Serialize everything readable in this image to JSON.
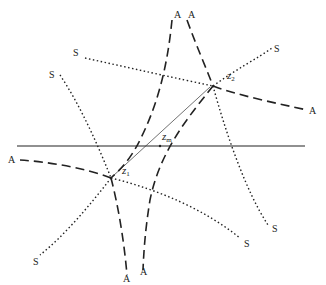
{
  "diagram": {
    "type": "saddle-point steepest-descent contours",
    "colors": {
      "ink": "#222222",
      "background": "#ffffff"
    },
    "axis": {
      "name": "real-axis",
      "label": ""
    },
    "points": {
      "z1": {
        "base": "z",
        "sub": "1"
      },
      "z2": {
        "base": "z",
        "sub": "2"
      },
      "zm": {
        "base": "z",
        "sub": "m"
      }
    },
    "labels": {
      "A_top_left": "A",
      "A_top_right": "A",
      "A_right": "A",
      "A_left": "A",
      "A_bottom_left": "A",
      "A_bottom_right": "A",
      "S_upper_left_1": "S",
      "S_upper_left_2": "S",
      "S_upper_right": "S",
      "S_lower_right_1": "S",
      "S_lower_right_2": "S",
      "S_lower_left": "S"
    },
    "legend": {
      "dashed": "A (ascent path)",
      "dotted": "S (steepest descent path)"
    }
  }
}
